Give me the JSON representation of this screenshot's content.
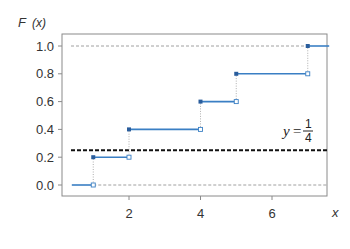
{
  "chart_data": {
    "type": "line",
    "subtype": "step-cdf",
    "title": "",
    "xlabel": "x",
    "ylabel": "F (x)",
    "xlim": [
      0.4,
      7.6
    ],
    "ylim": [
      -0.08,
      1.09
    ],
    "x_ticks": [
      2,
      4,
      6
    ],
    "x_tick_labels": [
      "2",
      "4",
      "6"
    ],
    "y_ticks": [
      0.0,
      0.2,
      0.4,
      0.6,
      0.8,
      1.0
    ],
    "y_tick_labels": [
      "0.0",
      "0.2",
      "0.4",
      "0.6",
      "0.8",
      "1.0"
    ],
    "grid": false,
    "legend": null,
    "series": [
      {
        "name": "F(x)",
        "color": "#3a7fc4",
        "steps": [
          {
            "x_start": 0.4,
            "x_end": 1,
            "y": 0.0,
            "closed_start": false,
            "open_end": true
          },
          {
            "x_start": 1,
            "x_end": 2,
            "y": 0.2,
            "closed_start": true,
            "open_end": true
          },
          {
            "x_start": 2,
            "x_end": 4,
            "y": 0.4,
            "closed_start": true,
            "open_end": true
          },
          {
            "x_start": 4,
            "x_end": 5,
            "y": 0.6,
            "closed_start": true,
            "open_end": true
          },
          {
            "x_start": 5,
            "x_end": 7,
            "y": 0.8,
            "closed_start": true,
            "open_end": true
          },
          {
            "x_start": 7,
            "x_end": 7.6,
            "y": 1.0,
            "closed_start": true,
            "open_end": false
          }
        ],
        "jump_points": [
          1,
          2,
          4,
          5,
          7
        ]
      }
    ],
    "reference_lines": [
      {
        "y": 0.0,
        "style": "dashed",
        "color": "#888888"
      },
      {
        "y": 1.0,
        "style": "dashed",
        "color": "#888888"
      },
      {
        "y": 0.25,
        "style": "dashed-bold",
        "color": "#111111",
        "label": "y=1/4"
      }
    ],
    "annotations": [
      {
        "text": "y=",
        "numerator": "1",
        "denominator": "4",
        "x": 6.5,
        "y": 0.3
      }
    ]
  },
  "labels": {
    "ylabel_f": "F",
    "ylabel_x": "(x)",
    "xlabel": "x",
    "annot_y": "y",
    "annot_eq": "=",
    "annot_num": "1",
    "annot_den": "4"
  }
}
